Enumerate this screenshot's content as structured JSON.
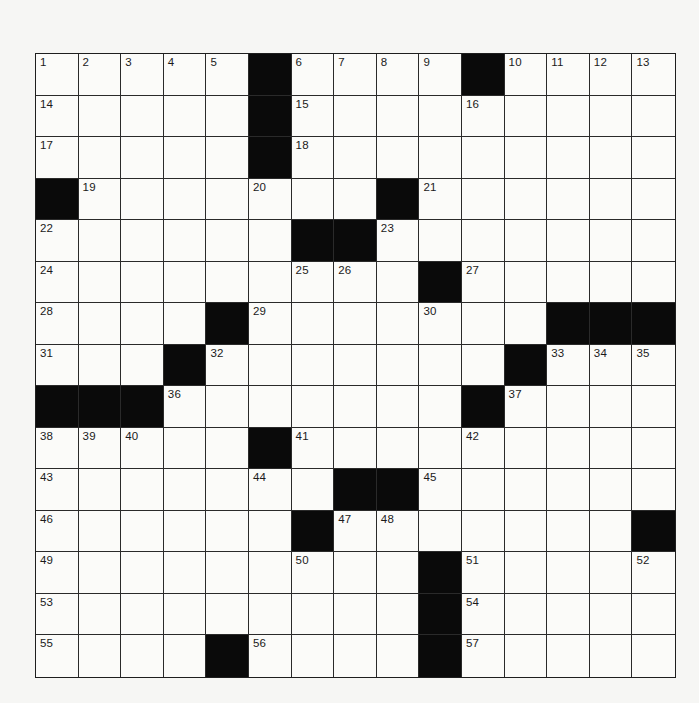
{
  "puzzle": {
    "rows": 15,
    "cols": 15,
    "colors": {
      "background": "#f6f6f4",
      "cell": "#fbfbf9",
      "block": "#0a0a0a",
      "line": "#2a2a2a",
      "number": "#1a1a1a"
    },
    "grid": [
      ".....#....#....",
      ".....#.........",
      ".....#.........",
      "#.......#......",
      "......##.......",
      ".........#.....",
      "....#.......###",
      "...#.......#...",
      "###.......#....",
      ".....#.........",
      ".......##......",
      "......#.......#",
      ".........#.....",
      ".........#.....",
      "....#....#....."
    ],
    "numbers": [
      {
        "n": "1",
        "r": 0,
        "c": 0
      },
      {
        "n": "2",
        "r": 0,
        "c": 1
      },
      {
        "n": "3",
        "r": 0,
        "c": 2
      },
      {
        "n": "4",
        "r": 0,
        "c": 3
      },
      {
        "n": "5",
        "r": 0,
        "c": 4
      },
      {
        "n": "6",
        "r": 0,
        "c": 6
      },
      {
        "n": "7",
        "r": 0,
        "c": 7
      },
      {
        "n": "8",
        "r": 0,
        "c": 8
      },
      {
        "n": "9",
        "r": 0,
        "c": 9
      },
      {
        "n": "10",
        "r": 0,
        "c": 11
      },
      {
        "n": "11",
        "r": 0,
        "c": 12
      },
      {
        "n": "12",
        "r": 0,
        "c": 13
      },
      {
        "n": "13",
        "r": 0,
        "c": 14
      },
      {
        "n": "14",
        "r": 1,
        "c": 0
      },
      {
        "n": "15",
        "r": 1,
        "c": 6
      },
      {
        "n": "16",
        "r": 1,
        "c": 10
      },
      {
        "n": "17",
        "r": 2,
        "c": 0
      },
      {
        "n": "18",
        "r": 2,
        "c": 6
      },
      {
        "n": "19",
        "r": 3,
        "c": 1
      },
      {
        "n": "20",
        "r": 3,
        "c": 5
      },
      {
        "n": "21",
        "r": 3,
        "c": 9
      },
      {
        "n": "22",
        "r": 4,
        "c": 0
      },
      {
        "n": "23",
        "r": 4,
        "c": 8
      },
      {
        "n": "24",
        "r": 5,
        "c": 0
      },
      {
        "n": "25",
        "r": 5,
        "c": 6
      },
      {
        "n": "26",
        "r": 5,
        "c": 7
      },
      {
        "n": "27",
        "r": 5,
        "c": 10
      },
      {
        "n": "28",
        "r": 6,
        "c": 0
      },
      {
        "n": "29",
        "r": 6,
        "c": 5
      },
      {
        "n": "30",
        "r": 6,
        "c": 9
      },
      {
        "n": "31",
        "r": 7,
        "c": 0
      },
      {
        "n": "32",
        "r": 7,
        "c": 4
      },
      {
        "n": "33",
        "r": 7,
        "c": 12
      },
      {
        "n": "34",
        "r": 7,
        "c": 13
      },
      {
        "n": "35",
        "r": 7,
        "c": 14
      },
      {
        "n": "36",
        "r": 8,
        "c": 3
      },
      {
        "n": "37",
        "r": 8,
        "c": 11
      },
      {
        "n": "38",
        "r": 9,
        "c": 0
      },
      {
        "n": "39",
        "r": 9,
        "c": 1
      },
      {
        "n": "40",
        "r": 9,
        "c": 2
      },
      {
        "n": "41",
        "r": 9,
        "c": 6
      },
      {
        "n": "42",
        "r": 9,
        "c": 10
      },
      {
        "n": "43",
        "r": 10,
        "c": 0
      },
      {
        "n": "44",
        "r": 10,
        "c": 5
      },
      {
        "n": "45",
        "r": 10,
        "c": 9
      },
      {
        "n": "46",
        "r": 11,
        "c": 0
      },
      {
        "n": "47",
        "r": 11,
        "c": 7
      },
      {
        "n": "48",
        "r": 11,
        "c": 8
      },
      {
        "n": "49",
        "r": 12,
        "c": 0
      },
      {
        "n": "50",
        "r": 12,
        "c": 6
      },
      {
        "n": "51",
        "r": 12,
        "c": 10
      },
      {
        "n": "52",
        "r": 12,
        "c": 14
      },
      {
        "n": "53",
        "r": 13,
        "c": 0
      },
      {
        "n": "54",
        "r": 13,
        "c": 10
      },
      {
        "n": "55",
        "r": 14,
        "c": 0
      },
      {
        "n": "56",
        "r": 14,
        "c": 5
      },
      {
        "n": "57",
        "r": 14,
        "c": 10
      }
    ]
  }
}
